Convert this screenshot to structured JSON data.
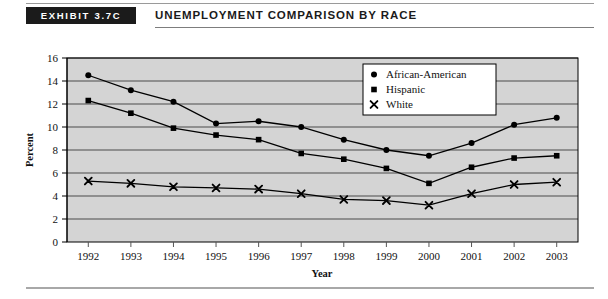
{
  "header": {
    "badge_label": "EXHIBIT 3.7C",
    "title": "UNEMPLOYMENT COMPARISON BY RACE"
  },
  "chart_data": {
    "type": "line",
    "title": "Unemployment Comparison by Race",
    "xlabel": "Year",
    "ylabel": "Percent",
    "categories": [
      "1992",
      "1993",
      "1994",
      "1995",
      "1996",
      "1997",
      "1998",
      "1999",
      "2000",
      "2001",
      "2002",
      "2003"
    ],
    "x": [
      1992,
      1993,
      1994,
      1995,
      1996,
      1997,
      1998,
      1999,
      2000,
      2001,
      2002,
      2003
    ],
    "series": [
      {
        "name": "African-American",
        "marker": "circle",
        "values": [
          14.5,
          13.2,
          12.2,
          10.3,
          10.5,
          10.0,
          8.9,
          8.0,
          7.5,
          8.6,
          10.2,
          10.8
        ]
      },
      {
        "name": "Hispanic",
        "marker": "square",
        "values": [
          12.3,
          11.2,
          9.9,
          9.3,
          8.9,
          7.7,
          7.2,
          6.4,
          5.1,
          6.5,
          7.3,
          7.5
        ]
      },
      {
        "name": "White",
        "marker": "x",
        "values": [
          5.3,
          5.1,
          4.8,
          4.7,
          4.6,
          4.2,
          3.7,
          3.6,
          3.2,
          4.2,
          5.0,
          5.2
        ]
      }
    ],
    "ylim": [
      0,
      16
    ],
    "yticks": [
      0,
      2,
      4,
      6,
      8,
      10,
      12,
      14,
      16
    ],
    "ytick_labels": [
      "0",
      "2",
      "4",
      "6",
      "8",
      "10",
      "12",
      "14",
      "16"
    ],
    "grid": true,
    "grid_axis": "y",
    "legend_position": "top-right",
    "legend_entries": [
      "African-American",
      "Hispanic",
      "White"
    ],
    "plot_background": "#d4d4d4",
    "line_color": "#000000",
    "gridline_color": "#4a4a4a",
    "frame_color": "#000000"
  }
}
